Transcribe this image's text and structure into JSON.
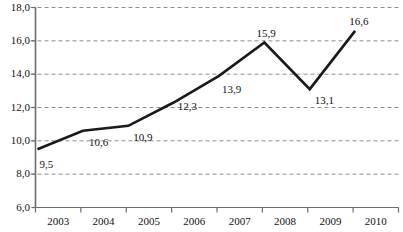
{
  "chart_data": {
    "type": "line",
    "title": "",
    "subtitle": "",
    "xlabel": "",
    "ylabel": "",
    "categories": [
      "2003",
      "2004",
      "2005",
      "2006",
      "2007",
      "2008",
      "2009",
      "2010"
    ],
    "values": [
      9.5,
      10.6,
      10.9,
      12.3,
      13.9,
      15.9,
      13.1,
      16.6
    ],
    "point_labels": [
      "9,5",
      "10,6",
      "10,9",
      "12,3",
      "13,9",
      "15,9",
      "13,1",
      "16,6"
    ],
    "ylim": [
      6.0,
      18.0
    ],
    "ytick_values": [
      6.0,
      8.0,
      10.0,
      12.0,
      14.0,
      16.0,
      18.0
    ],
    "ytick_labels": [
      "6,0",
      "8,0",
      "10,0",
      "12,0",
      "14,0",
      "16,0",
      "18,0"
    ],
    "grid": true,
    "grid_style": "dashed",
    "grid_color": "#8c8c8c",
    "legend": false,
    "legend_position": "none",
    "series_color": "#1a1a1a",
    "axis_color": "#6b6b6b",
    "markers": false
  }
}
